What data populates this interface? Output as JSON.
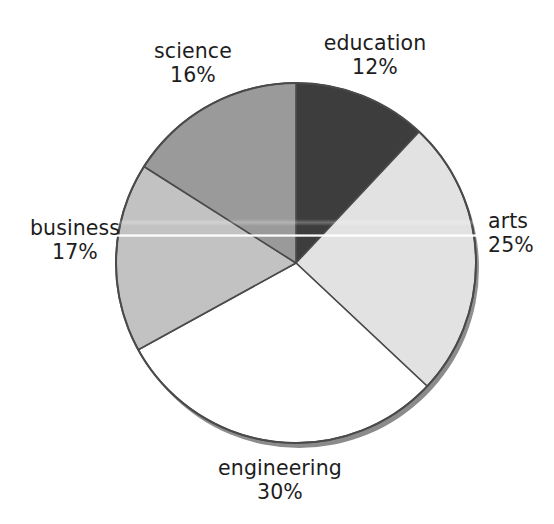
{
  "figure": {
    "title_clipped": "",
    "background_color": "#ffffff",
    "width": 554,
    "height": 524
  },
  "artifacts": {
    "scan_line_label": "horizontal white scan line",
    "clipped_text_label": "clipped header text"
  },
  "chart_data": {
    "type": "pie",
    "title": "",
    "xlabel": "",
    "ylabel": "",
    "categories": [
      "education",
      "arts",
      "engineering",
      "business",
      "science"
    ],
    "values": [
      12,
      25,
      30,
      17,
      16
    ],
    "value_unit": "%",
    "start_angle_deg": 0,
    "direction": "clockwise",
    "legend": "none",
    "grid": false,
    "slices": [
      {
        "label": "education",
        "value": 12,
        "value_text": "12%",
        "color": "#3d3d3d",
        "start_deg": 0,
        "end_deg": 43.2,
        "label_position": "top-right"
      },
      {
        "label": "arts",
        "value": 25,
        "value_text": "25%",
        "color": "#e2e2e2",
        "start_deg": 43.2,
        "end_deg": 133.2,
        "label_position": "right"
      },
      {
        "label": "engineering",
        "value": 30,
        "value_text": "30%",
        "color": "#ffffff",
        "start_deg": 133.2,
        "end_deg": 241.2,
        "label_position": "bottom"
      },
      {
        "label": "business",
        "value": 17,
        "value_text": "17%",
        "color": "#c2c2c2",
        "start_deg": 241.2,
        "end_deg": 302.4,
        "label_position": "left"
      },
      {
        "label": "science",
        "value": 16,
        "value_text": "16%",
        "color": "#9a9a9a",
        "start_deg": 302.4,
        "end_deg": 360,
        "label_position": "top-left"
      }
    ],
    "geometry": {
      "center_x": 296,
      "center_y": 263,
      "radius": 180,
      "outline_color": "#4a4a4a",
      "shadow_color": "#9d9d9d"
    }
  },
  "labels": {
    "science": {
      "name": "science",
      "pct": "16%"
    },
    "education": {
      "name": "education",
      "pct": "12%"
    },
    "arts": {
      "name": "arts",
      "pct": "25%"
    },
    "business": {
      "name": "business",
      "pct": "17%"
    },
    "engineering": {
      "name": "engineering",
      "pct": "30%"
    }
  }
}
